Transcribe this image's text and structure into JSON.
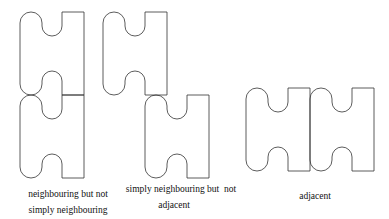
{
  "figure": {
    "stroke_color": "#333333",
    "background": "#ffffff",
    "groups": [
      {
        "id": "neighbouring-not-simply",
        "caption_lines": [
          "neighbouring but not",
          "simply neighbouring"
        ],
        "pieces": [
          {
            "x": 20,
            "y": 12
          },
          {
            "x": 20,
            "y": 95
          }
        ]
      },
      {
        "id": "simply-neighbouring-not-adjacent",
        "caption_lines": [
          "simply neighbouring but  not",
          "adjacent"
        ],
        "pieces": [
          {
            "x": 103,
            "y": 12
          },
          {
            "x": 145,
            "y": 95
          }
        ]
      },
      {
        "id": "adjacent",
        "caption_lines": [
          "adjacent"
        ],
        "pieces": [
          {
            "x": 246,
            "y": 88
          },
          {
            "x": 310,
            "y": 88
          }
        ]
      }
    ]
  }
}
